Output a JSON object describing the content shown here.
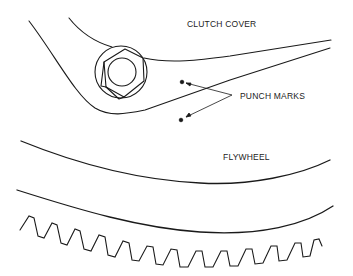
{
  "diagram": {
    "labels": {
      "clutch_cover": "CLUTCH COVER",
      "punch_marks": "PUNCH MARKS",
      "flywheel": "FLYWHEEL"
    },
    "parts": [
      "clutch cover",
      "hex bolt",
      "punch marks",
      "flywheel",
      "ring gear teeth"
    ],
    "colors": {
      "line": "#1a1a1a",
      "background": "#ffffff"
    }
  }
}
